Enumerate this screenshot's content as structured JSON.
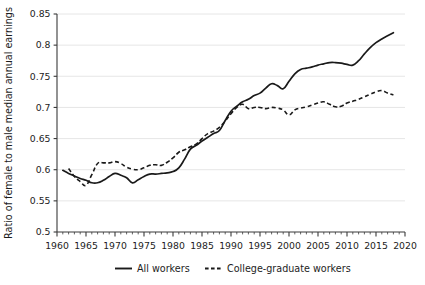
{
  "chart_data": {
    "type": "line",
    "title": "",
    "xlabel": "",
    "ylabel": "Ratio of female to male median annual earnings",
    "xlim": [
      1960,
      2020
    ],
    "ylim": [
      0.5,
      0.85
    ],
    "grid": true,
    "legend_position": "bottom",
    "x_ticks": [
      1960,
      1965,
      1970,
      1975,
      1980,
      1985,
      1990,
      1995,
      2000,
      2005,
      2010,
      2015,
      2020
    ],
    "x_tick_labels": [
      "1960",
      "1965",
      "1970",
      "1975",
      "1980",
      "1985",
      "1990",
      "1995",
      "2000",
      "2005",
      "2010",
      "2015",
      "2020"
    ],
    "y_ticks": [
      0.5,
      0.55,
      0.6,
      0.65,
      0.7,
      0.75,
      0.8,
      0.85
    ],
    "y_tick_labels": [
      "0.5",
      "0.55",
      "0.6",
      "0.65",
      "0.7",
      "0.75",
      "0.8",
      "0.85"
    ],
    "x_minor_tick_step": 1,
    "series": [
      {
        "name": "All workers",
        "style": "solid",
        "color": "#1a1a1a",
        "x": [
          1961,
          1962,
          1963,
          1964,
          1965,
          1966,
          1967,
          1968,
          1969,
          1970,
          1971,
          1972,
          1973,
          1974,
          1975,
          1976,
          1977,
          1978,
          1979,
          1980,
          1981,
          1982,
          1983,
          1984,
          1985,
          1986,
          1987,
          1988,
          1989,
          1990,
          1991,
          1992,
          1993,
          1994,
          1995,
          1996,
          1997,
          1998,
          1999,
          2000,
          2001,
          2002,
          2003,
          2004,
          2005,
          2006,
          2007,
          2008,
          2009,
          2010,
          2011,
          2012,
          2013,
          2014,
          2015,
          2016,
          2017,
          2018
        ],
        "values": [
          0.599,
          0.594,
          0.59,
          0.586,
          0.583,
          0.579,
          0.579,
          0.583,
          0.589,
          0.594,
          0.591,
          0.587,
          0.579,
          0.584,
          0.589,
          0.593,
          0.593,
          0.594,
          0.595,
          0.597,
          0.603,
          0.617,
          0.633,
          0.639,
          0.646,
          0.652,
          0.658,
          0.663,
          0.679,
          0.694,
          0.702,
          0.709,
          0.713,
          0.719,
          0.723,
          0.731,
          0.738,
          0.735,
          0.73,
          0.742,
          0.754,
          0.761,
          0.763,
          0.765,
          0.768,
          0.77,
          0.772,
          0.772,
          0.771,
          0.769,
          0.768,
          0.775,
          0.786,
          0.796,
          0.804,
          0.81,
          0.815,
          0.82
        ]
      },
      {
        "name": "College-graduate workers",
        "style": "dashed",
        "color": "#1a1a1a",
        "x": [
          1962,
          1963,
          1964,
          1965,
          1966,
          1967,
          1968,
          1969,
          1970,
          1971,
          1972,
          1973,
          1974,
          1975,
          1976,
          1977,
          1978,
          1979,
          1980,
          1981,
          1982,
          1983,
          1984,
          1985,
          1986,
          1987,
          1988,
          1989,
          1990,
          1991,
          1992,
          1993,
          1994,
          1995,
          1996,
          1997,
          1998,
          1999,
          2000,
          2001,
          2002,
          2003,
          2004,
          2005,
          2006,
          2007,
          2008,
          2009,
          2010,
          2011,
          2012,
          2013,
          2014,
          2015,
          2016,
          2017,
          2018
        ],
        "values": [
          0.602,
          0.589,
          0.581,
          0.575,
          0.592,
          0.61,
          0.611,
          0.611,
          0.613,
          0.61,
          0.604,
          0.601,
          0.6,
          0.603,
          0.607,
          0.608,
          0.607,
          0.612,
          0.619,
          0.628,
          0.632,
          0.637,
          0.641,
          0.65,
          0.658,
          0.662,
          0.668,
          0.678,
          0.69,
          0.7,
          0.705,
          0.698,
          0.7,
          0.7,
          0.698,
          0.7,
          0.699,
          0.696,
          0.688,
          0.696,
          0.699,
          0.701,
          0.704,
          0.707,
          0.709,
          0.705,
          0.701,
          0.702,
          0.707,
          0.71,
          0.713,
          0.717,
          0.721,
          0.725,
          0.727,
          0.723,
          0.72
        ]
      }
    ]
  },
  "legend": {
    "items": [
      {
        "label": "All workers",
        "style": "solid"
      },
      {
        "label": "College-graduate workers",
        "style": "dashed"
      }
    ]
  }
}
